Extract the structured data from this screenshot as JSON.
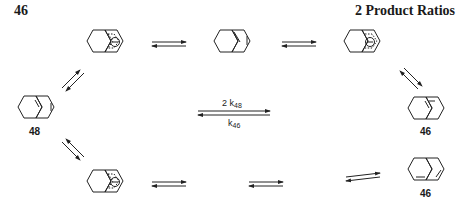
{
  "page": {
    "number": "46",
    "header": "2  Product Ratios"
  },
  "scheme": {
    "compounds": [
      {
        "id": "anion-top-left",
        "type": "tetrahydronaphthalenide anion, delocalized",
        "charge": "⊖"
      },
      {
        "id": "diene-top-center",
        "type": "hexahydronaphthalene"
      },
      {
        "id": "anion-top-right",
        "type": "cross-conjugated anion",
        "charge": "⊖"
      },
      {
        "id": "compound-48",
        "label": "48"
      },
      {
        "id": "compound-46-upper",
        "label": "46"
      },
      {
        "id": "anion-bottom-left",
        "type": "tetrahydronaphthalenide anion, delocalized",
        "charge": "⊖"
      },
      {
        "id": "compound-46-lower",
        "label": "46"
      }
    ],
    "rate_labels": {
      "forward": "2 k",
      "forward_sub": "48",
      "reverse": "k",
      "reverse_sub": "46"
    }
  }
}
